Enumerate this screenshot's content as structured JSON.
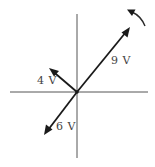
{
  "diagram": {
    "type": "phasor-diagram",
    "axes": {
      "horizontal": {
        "x1": 10,
        "y": 92,
        "x2": 148
      },
      "vertical": {
        "x": 77,
        "y1": 14,
        "y2": 158
      },
      "origin": {
        "x": 77,
        "y": 92
      }
    },
    "phasors": [
      {
        "id": "v9",
        "label": "9 V",
        "magnitude": 9,
        "unit": "V",
        "angle_deg": 45,
        "direction": "up-right"
      },
      {
        "id": "v6",
        "label": "6 V",
        "magnitude": 6,
        "unit": "V",
        "angle_deg": 225,
        "direction": "down-left"
      },
      {
        "id": "v4",
        "label": "4 V",
        "magnitude": 4,
        "unit": "V",
        "angle_deg": 135,
        "direction": "up-left"
      }
    ],
    "rotation": {
      "direction": "counterclockwise"
    },
    "colors": {
      "phasor": "#1a1a1a",
      "axis": "#555555",
      "label": "#444444",
      "background": "#ffffff"
    }
  }
}
